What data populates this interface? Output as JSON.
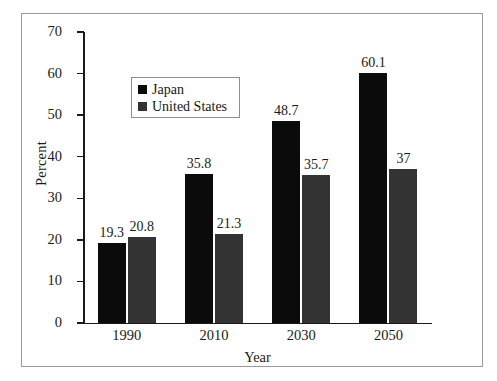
{
  "chart_data": {
    "type": "bar",
    "title": "",
    "xlabel": "Year",
    "ylabel": "Percent",
    "categories": [
      "1990",
      "2010",
      "2030",
      "2050"
    ],
    "series": [
      {
        "name": "Japan",
        "color": "#0b0b0b",
        "values": [
          19.3,
          35.8,
          48.7,
          60.1
        ],
        "labels": [
          "19.3",
          "35.8",
          "48.7",
          "60.1"
        ]
      },
      {
        "name": "United States",
        "color": "#333333",
        "values": [
          20.8,
          21.3,
          35.7,
          37
        ],
        "labels": [
          "20.8",
          "21.3",
          "35.7",
          "37"
        ]
      }
    ],
    "ylim": [
      0,
      70
    ],
    "yticks": [
      0,
      10,
      20,
      30,
      40,
      50,
      60,
      70
    ],
    "ytick_labels": [
      "0",
      "10",
      "20",
      "30",
      "40",
      "50",
      "60",
      "70"
    ],
    "grid": false,
    "legend_position": "upper-left-inside",
    "legend_entries": [
      "Japan",
      "United States"
    ]
  }
}
